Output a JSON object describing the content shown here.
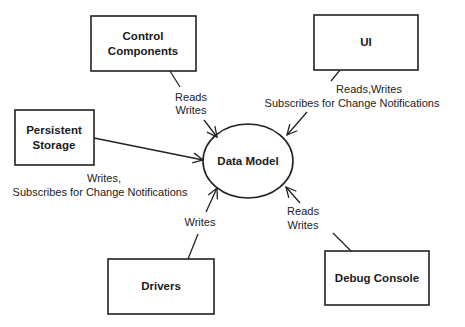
{
  "diagram": {
    "center": {
      "label": "Data Model",
      "cx": 248,
      "cy": 161,
      "rx": 45,
      "ry": 37
    },
    "nodes": [
      {
        "id": "control",
        "lines": [
          "Control",
          "Components"
        ],
        "x": 91,
        "y": 16,
        "w": 105,
        "h": 55
      },
      {
        "id": "ui",
        "lines": [
          "UI"
        ],
        "x": 314,
        "y": 15,
        "w": 104,
        "h": 55
      },
      {
        "id": "persistent",
        "lines": [
          "Persistent",
          "Storage"
        ],
        "x": 15,
        "y": 110,
        "w": 79,
        "h": 55
      },
      {
        "id": "drivers",
        "lines": [
          "Drivers"
        ],
        "x": 108,
        "y": 259,
        "w": 106,
        "h": 55
      },
      {
        "id": "debug",
        "lines": [
          "Debug Console"
        ],
        "x": 325,
        "y": 251,
        "w": 104,
        "h": 54
      }
    ],
    "edges": [
      {
        "from": "control",
        "to": "Data Model",
        "label_lines": [
          "Reads",
          "Writes"
        ]
      },
      {
        "from": "ui",
        "to": "Data Model",
        "label_lines": [
          "Reads,Writes",
          "Subscribes for Change Notifications"
        ]
      },
      {
        "from": "persistent",
        "to": "Data Model",
        "label_lines": [
          "Writes,",
          "Subscribes for Change Notifications"
        ]
      },
      {
        "from": "drivers",
        "to": "Data Model",
        "label_lines": [
          "Writes"
        ]
      },
      {
        "from": "debug",
        "to": "Data Model",
        "label_lines": [
          "Reads",
          "Writes"
        ]
      }
    ],
    "colors": {
      "stroke": "#222222",
      "background": "#ffffff",
      "text": "#1a1a1a"
    }
  }
}
